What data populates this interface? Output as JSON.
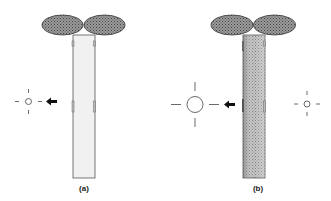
{
  "panels": [
    {
      "id": "a",
      "label": "(a)",
      "stem_fill": "light",
      "description": "seedling stem uniformly lit, single small light source on left"
    },
    {
      "id": "b",
      "label": "(b)",
      "stem_fill": "shaded",
      "description": "seedling stem shaded, large light source on left and small light source on right"
    }
  ],
  "colors": {
    "leaf": "#7a7a7a",
    "leaf_outline": "#333333",
    "stem_light": "#f0f0f0",
    "stem_dark": "#a8a8a8",
    "outline": "#444444",
    "arrow": "#111111"
  }
}
